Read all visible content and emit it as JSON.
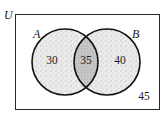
{
  "diagram": {
    "type": "venn",
    "universe_label": "U",
    "sets": [
      {
        "label": "A"
      },
      {
        "label": "B"
      }
    ],
    "regions": {
      "a_only": "30",
      "a_and_b": "35",
      "b_only": "40",
      "neither": "45"
    },
    "colors": {
      "outline": "#1a1a1a",
      "fill": "#d8d8d8",
      "overlap_fill": "#b8b8b8",
      "background": "#ffffff"
    }
  }
}
